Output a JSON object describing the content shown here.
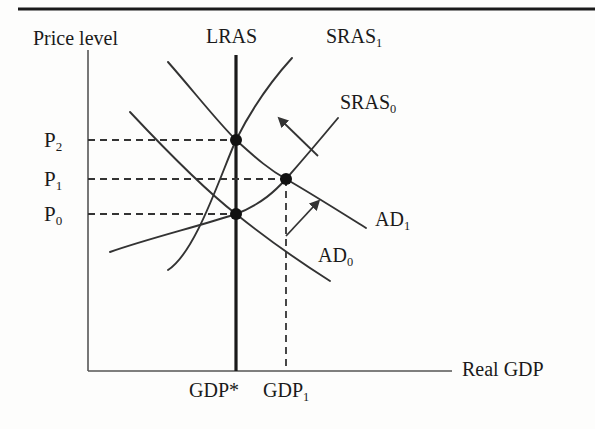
{
  "figure": {
    "type": "economics-diagram",
    "name": "AD-AS model with short-run and long-run aggregate supply",
    "top_rule": true
  },
  "axes": {
    "y_label": "Price level",
    "x_label": "Real GDP",
    "y_axis_x": 88,
    "y_axis_top": 50,
    "y_axis_bottom": 371,
    "x_axis_left": 88,
    "x_axis_right": 452,
    "x_axis_y": 371
  },
  "curves": {
    "lras": {
      "label": "LRAS",
      "x": 236,
      "top": 55,
      "bottom": 371
    },
    "sras1": {
      "label": "SRAS",
      "sub": "1"
    },
    "sras0": {
      "label": "SRAS",
      "sub": "0"
    },
    "ad1": {
      "label": "AD",
      "sub": "1"
    },
    "ad0": {
      "label": "AD",
      "sub": "0"
    }
  },
  "price_ticks": [
    {
      "id": "p2",
      "label": "P",
      "sub": "2",
      "y": 140
    },
    {
      "id": "p1",
      "label": "P",
      "sub": "1",
      "y": 179
    },
    {
      "id": "p0",
      "label": "P",
      "sub": "0",
      "y": 214
    }
  ],
  "gdp_ticks": [
    {
      "id": "gdp_star",
      "label": "GDP*",
      "x": 236
    },
    {
      "id": "gdp_1",
      "label": "GDP",
      "sub": "1",
      "x": 297
    }
  ],
  "equilibria": [
    {
      "id": "e2",
      "x": 236,
      "y": 140,
      "price": "P2",
      "output": "GDP*"
    },
    {
      "id": "e1",
      "x": 286,
      "y": 179,
      "price": "P1",
      "output": "GDP1"
    },
    {
      "id": "e0",
      "x": 236,
      "y": 214,
      "price": "P0",
      "output": "GDP*"
    }
  ],
  "shift_arrows": [
    {
      "id": "sras-shift-arrow",
      "from_x": 318,
      "from_y": 156,
      "to_x": 281,
      "to_y": 120
    },
    {
      "id": "ad-shift-arrow",
      "from_x": 286,
      "from_y": 235,
      "to_x": 317,
      "to_y": 203
    }
  ],
  "colors": {
    "ink": "#1a1a1a",
    "curve": "#333333",
    "axis": "#444444",
    "dashed": "#333333",
    "background": "#fdfdfc"
  }
}
